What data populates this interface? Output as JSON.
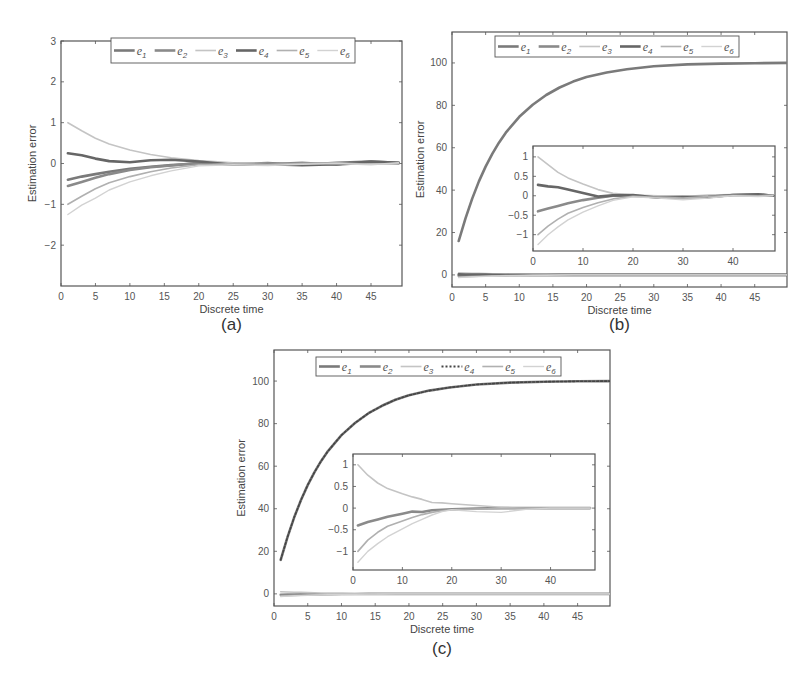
{
  "figure": {
    "panels": [
      "(a)",
      "(b)",
      "(c)"
    ]
  },
  "colors": {
    "e1": "#7a7a7a",
    "e2": "#8a8a8a",
    "e3": "#c4c4c4",
    "e4": "#666666",
    "e5": "#b0b0b0",
    "e6": "#d2d2d2",
    "axis": "#555555"
  },
  "chart_data": [
    {
      "id": "a",
      "type": "line",
      "caption": "(a)",
      "title": "",
      "xlabel": "Discrete time",
      "ylabel": "Estimation error",
      "xlim": [
        0,
        49.5
      ],
      "ylim": [
        -3,
        3
      ],
      "xticks": [
        0,
        5,
        10,
        15,
        20,
        25,
        30,
        35,
        40,
        45
      ],
      "yticks": [
        -2,
        -1,
        0,
        1,
        2,
        3
      ],
      "ytick_labels": [
        "−2",
        "−1",
        "0",
        "1",
        "2",
        "3"
      ],
      "legend": [
        "e1",
        "e2",
        "e3",
        "e4",
        "e5",
        "e6"
      ],
      "legend_position": "top-center",
      "x": [
        1,
        3,
        5,
        7,
        10,
        13,
        16,
        20,
        25,
        30,
        35,
        40,
        45,
        49
      ],
      "series": [
        {
          "name": "e1",
          "values": [
            -0.4,
            -0.32,
            -0.26,
            -0.2,
            -0.13,
            -0.08,
            -0.04,
            0.0,
            -0.02,
            0.01,
            -0.03,
            0.02,
            0.05,
            0.02
          ]
        },
        {
          "name": "e2",
          "values": [
            -0.55,
            -0.45,
            -0.35,
            -0.26,
            -0.16,
            -0.09,
            -0.05,
            0.02,
            0.0,
            -0.02,
            0.02,
            -0.03,
            0.03,
            0.0
          ]
        },
        {
          "name": "e3",
          "values": [
            1.0,
            0.8,
            0.62,
            0.48,
            0.33,
            0.22,
            0.14,
            0.07,
            0.02,
            0.0,
            -0.02,
            0.01,
            0.0,
            0.02
          ]
        },
        {
          "name": "e4",
          "values": [
            0.25,
            0.2,
            0.12,
            0.06,
            0.03,
            0.08,
            0.09,
            0.05,
            -0.03,
            -0.02,
            -0.04,
            -0.02,
            0.05,
            0.02
          ]
        },
        {
          "name": "e5",
          "values": [
            -1.0,
            -0.8,
            -0.62,
            -0.47,
            -0.32,
            -0.2,
            -0.11,
            -0.03,
            0.0,
            -0.02,
            0.0,
            0.02,
            -0.02,
            0.0
          ]
        },
        {
          "name": "e6",
          "values": [
            -1.25,
            -1.02,
            -0.85,
            -0.65,
            -0.45,
            -0.3,
            -0.18,
            -0.06,
            -0.03,
            -0.05,
            -0.02,
            0.0,
            -0.03,
            0.02
          ]
        }
      ]
    },
    {
      "id": "b",
      "type": "line",
      "caption": "(b)",
      "title": "",
      "xlabel": "Discrete time",
      "ylabel": "Estimation error",
      "xlim": [
        0,
        49.8
      ],
      "ylim": [
        -5.7,
        114.6
      ],
      "xticks": [
        0,
        5,
        10,
        15,
        20,
        25,
        30,
        35,
        40,
        45
      ],
      "yticks": [
        0,
        20,
        40,
        60,
        80,
        100
      ],
      "legend": [
        "e1",
        "e2",
        "e3",
        "e4",
        "e5",
        "e6"
      ],
      "legend_position": "top-center",
      "x": [
        1,
        2,
        3,
        4,
        5,
        6,
        7,
        8,
        10,
        12,
        14,
        16,
        18,
        20,
        23,
        26,
        30,
        35,
        40,
        45,
        49.8
      ],
      "series": [
        {
          "name": "e1",
          "values": [
            16,
            26.7,
            36.0,
            44.1,
            51.1,
            57.2,
            62.5,
            67.1,
            74.6,
            80.3,
            84.9,
            88.4,
            91.2,
            93.3,
            95.5,
            97.0,
            98.4,
            99.3,
            99.7,
            99.9,
            100
          ]
        },
        {
          "name": "e2",
          "values": [
            -0.4,
            -0.3,
            -0.3,
            -0.25,
            -0.2,
            -0.18,
            -0.15,
            -0.12,
            -0.08,
            -0.05,
            -0.02,
            0,
            0,
            0,
            0,
            0,
            0,
            0,
            0,
            0,
            0
          ]
        },
        {
          "name": "e3",
          "values": [
            1.0,
            0.9,
            0.8,
            0.7,
            0.6,
            0.5,
            0.4,
            0.3,
            0.2,
            0.1,
            0.05,
            0,
            0,
            0,
            0,
            0,
            0,
            0,
            0,
            0,
            0
          ]
        },
        {
          "name": "e4",
          "values": [
            0.25,
            0.2,
            0.2,
            0.2,
            0.15,
            0.12,
            0.1,
            0.08,
            0.05,
            0.02,
            0,
            0,
            0,
            0,
            0,
            0,
            0,
            0,
            0,
            0,
            0
          ]
        },
        {
          "name": "e5",
          "values": [
            -1.0,
            -0.85,
            -0.75,
            -0.65,
            -0.55,
            -0.45,
            -0.38,
            -0.3,
            -0.2,
            -0.12,
            -0.06,
            -0.02,
            0,
            0,
            0,
            0,
            0,
            0,
            0,
            0,
            0
          ]
        },
        {
          "name": "e6",
          "values": [
            -1.25,
            -1.05,
            -0.9,
            -0.8,
            -0.7,
            -0.6,
            -0.5,
            -0.42,
            -0.3,
            -0.2,
            -0.12,
            -0.05,
            0,
            0,
            0,
            0,
            0,
            0,
            0,
            0,
            0
          ]
        }
      ],
      "inset": {
        "xlim": [
          0,
          48.4
        ],
        "ylim": [
          -1.42,
          1.28
        ],
        "xticks": [
          0,
          10,
          20,
          30,
          40
        ],
        "yticks": [
          -1,
          -0.5,
          0,
          0.5,
          1
        ],
        "ytick_labels": [
          "−1",
          "−0.5",
          "0",
          "0.5",
          "1"
        ],
        "x": [
          1,
          3,
          5,
          7,
          10,
          13,
          16,
          20,
          25,
          30,
          35,
          40,
          45,
          48
        ],
        "series": [
          {
            "name": "e2",
            "values": [
              -0.4,
              -0.33,
              -0.26,
              -0.19,
              -0.11,
              -0.05,
              0.0,
              0.0,
              -0.03,
              -0.02,
              -0.04,
              0.02,
              0.03,
              0.0
            ]
          },
          {
            "name": "e3",
            "values": [
              1.0,
              0.8,
              0.6,
              0.46,
              0.3,
              0.16,
              0.06,
              0.02,
              0.0,
              -0.02,
              0.02,
              0.03,
              0.04,
              0.0
            ]
          },
          {
            "name": "e4",
            "values": [
              0.28,
              0.24,
              0.22,
              0.16,
              0.07,
              -0.02,
              0.01,
              0.02,
              -0.05,
              -0.04,
              -0.03,
              0.02,
              0.04,
              0.0
            ]
          },
          {
            "name": "e5",
            "values": [
              -1.0,
              -0.78,
              -0.6,
              -0.45,
              -0.3,
              -0.18,
              -0.08,
              -0.01,
              -0.04,
              -0.06,
              -0.02,
              0.01,
              0.0,
              0.02
            ]
          },
          {
            "name": "e6",
            "values": [
              -1.25,
              -1.0,
              -0.8,
              -0.62,
              -0.42,
              -0.26,
              -0.12,
              -0.03,
              -0.06,
              -0.1,
              -0.06,
              0.0,
              -0.02,
              0.0
            ]
          }
        ]
      }
    },
    {
      "id": "c",
      "type": "line",
      "caption": "(c)",
      "title": "",
      "xlabel": "Discrete time",
      "ylabel": "Estimation error",
      "xlim": [
        0,
        49.8
      ],
      "ylim": [
        -5.7,
        114.6
      ],
      "xticks": [
        0,
        5,
        10,
        15,
        20,
        25,
        30,
        35,
        40,
        45
      ],
      "yticks": [
        0,
        20,
        40,
        60,
        80,
        100
      ],
      "legend": [
        "e1",
        "e2",
        "e3",
        "e4",
        "e5",
        "e6"
      ],
      "legend_dotted": [
        "e4"
      ],
      "legend_position": "top-center",
      "x": [
        1,
        2,
        3,
        4,
        5,
        6,
        7,
        8,
        10,
        12,
        14,
        16,
        18,
        20,
        23,
        26,
        30,
        35,
        40,
        45,
        49.8
      ],
      "series": [
        {
          "name": "e1",
          "values": [
            16,
            26.7,
            36.0,
            44.1,
            51.1,
            57.2,
            62.5,
            67.1,
            74.6,
            80.3,
            84.9,
            88.4,
            91.2,
            93.3,
            95.5,
            97.0,
            98.4,
            99.3,
            99.7,
            99.9,
            100
          ]
        },
        {
          "name": "e4",
          "values": [
            16,
            26.7,
            36.0,
            44.1,
            51.1,
            57.2,
            62.5,
            67.1,
            74.6,
            80.3,
            84.9,
            88.4,
            91.2,
            93.3,
            95.5,
            97.0,
            98.4,
            99.3,
            99.7,
            99.9,
            100
          ]
        },
        {
          "name": "e2",
          "values": [
            -0.4,
            -0.3,
            -0.3,
            -0.25,
            -0.2,
            -0.18,
            -0.15,
            -0.12,
            -0.08,
            -0.05,
            -0.02,
            0,
            0,
            0,
            0,
            0,
            0,
            0,
            0,
            0,
            0
          ]
        },
        {
          "name": "e3",
          "values": [
            1.0,
            0.9,
            0.8,
            0.7,
            0.6,
            0.5,
            0.4,
            0.3,
            0.2,
            0.1,
            0.05,
            0,
            0,
            0,
            0,
            0,
            0,
            0,
            0,
            0,
            0
          ]
        },
        {
          "name": "e5",
          "values": [
            -1.0,
            -0.85,
            -0.75,
            -0.65,
            -0.55,
            -0.45,
            -0.38,
            -0.3,
            -0.2,
            -0.12,
            -0.06,
            -0.02,
            0,
            0,
            0,
            0,
            0,
            0,
            0,
            0,
            0
          ]
        },
        {
          "name": "e6",
          "values": [
            -1.25,
            -1.05,
            -0.9,
            -0.8,
            -0.7,
            -0.6,
            -0.5,
            -0.42,
            -0.3,
            -0.2,
            -0.12,
            -0.05,
            0,
            0,
            0,
            0,
            0,
            0,
            0,
            0,
            0
          ]
        }
      ],
      "inset": {
        "xlim": [
          0,
          49
        ],
        "ylim": [
          -1.43,
          1.25
        ],
        "xticks": [
          0,
          10,
          20,
          30,
          40
        ],
        "yticks": [
          -1,
          -0.5,
          0,
          0.5,
          1
        ],
        "ytick_labels": [
          "−1",
          "−0.5",
          "0",
          "0.5",
          "1"
        ],
        "x": [
          1,
          3,
          5,
          7,
          10,
          12,
          14,
          16,
          18,
          20,
          25,
          30,
          35,
          40,
          45,
          48
        ],
        "series": [
          {
            "name": "e2",
            "values": [
              -0.4,
              -0.32,
              -0.26,
              -0.2,
              -0.13,
              -0.08,
              -0.09,
              -0.05,
              -0.04,
              -0.03,
              -0.01,
              0.0,
              0.0,
              0.0,
              0.0,
              0.0
            ]
          },
          {
            "name": "e3",
            "values": [
              1.0,
              0.76,
              0.58,
              0.45,
              0.33,
              0.26,
              0.2,
              0.13,
              0.12,
              0.1,
              0.06,
              0.02,
              -0.01,
              0.0,
              0.0,
              0.0
            ]
          },
          {
            "name": "e5",
            "values": [
              -1.0,
              -0.74,
              -0.56,
              -0.42,
              -0.3,
              -0.22,
              -0.15,
              -0.1,
              -0.06,
              -0.04,
              -0.02,
              -0.01,
              0.0,
              0.0,
              0.01,
              0.0
            ]
          },
          {
            "name": "e6",
            "values": [
              -1.25,
              -1.0,
              -0.82,
              -0.66,
              -0.48,
              -0.36,
              -0.26,
              -0.16,
              -0.08,
              -0.04,
              -0.08,
              -0.1,
              -0.03,
              0.0,
              0.0,
              0.0
            ]
          }
        ]
      }
    }
  ]
}
